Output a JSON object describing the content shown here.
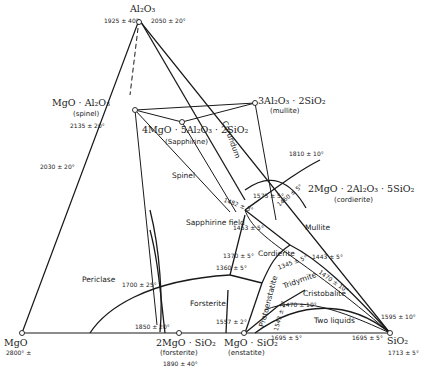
{
  "diagram": {
    "type": "ternary-phase-diagram",
    "system": "MgO-Al2O3-SiO2"
  },
  "vertices": {
    "top": {
      "formula": "Al₂O₃",
      "temps": [
        "1925 ± 40°",
        "2050 ± 20°"
      ]
    },
    "left": {
      "formula": "MgO",
      "temp": "2800° ±"
    },
    "right": {
      "formula": "SiO₂",
      "temp": "1713 ± 5°"
    }
  },
  "compounds": [
    {
      "formula": "MgO · Al₂O₃",
      "name": "(spinel)",
      "temp": "2135 ± 20°"
    },
    {
      "formula": "3Al₂O₃ · 2SiO₂",
      "name": "(mullite)"
    },
    {
      "formula": "4MgO · 5Al₂O₃ · 2SiO₂",
      "name": "(Sapphirine)"
    },
    {
      "formula": "2MgO · 2Al₂O₃ · 5SiO₂",
      "name": "(cordierite)"
    },
    {
      "formula": "2MgO · SiO₂",
      "name": "(forsterite)",
      "temp": "1890 ± 40°"
    },
    {
      "formula": "MgO · SiO₂",
      "name": "(enstatite)"
    }
  ],
  "fields": [
    "Spinel",
    "Corundum",
    "Periclase",
    "Forsterite",
    "Mullite",
    "Cordierite",
    "Sapphirine field",
    "Protoenstatite",
    "Tridymite",
    "Cristobalite",
    "Two liquids"
  ],
  "temperatures": {
    "t2030": "2030 ± 20°",
    "t1810": "1810 ± 10°",
    "t1575": "1575 ± 5°",
    "t1460": "1460 ± 5°",
    "t1482": "1482 ± 3°",
    "t1453": "1453 ± 5°",
    "t1700": "1700 ± 25°",
    "t1370": "1370 ± 5°",
    "t1360": "1360 ± 5°",
    "t1443": "1443 ± 5°",
    "t1345": "1345 ± 5°",
    "t1470a": "1470 ± 10°",
    "t1470b": "1470 ± 10°",
    "t1543": "1543 ± 2°",
    "t1595": "1595 ± 10°",
    "t1557": "1557 ± 2°",
    "t1850": "1850 ± 20°",
    "t1695a": "1695 ± 5°",
    "t1695b": "1695 ± 5°"
  }
}
